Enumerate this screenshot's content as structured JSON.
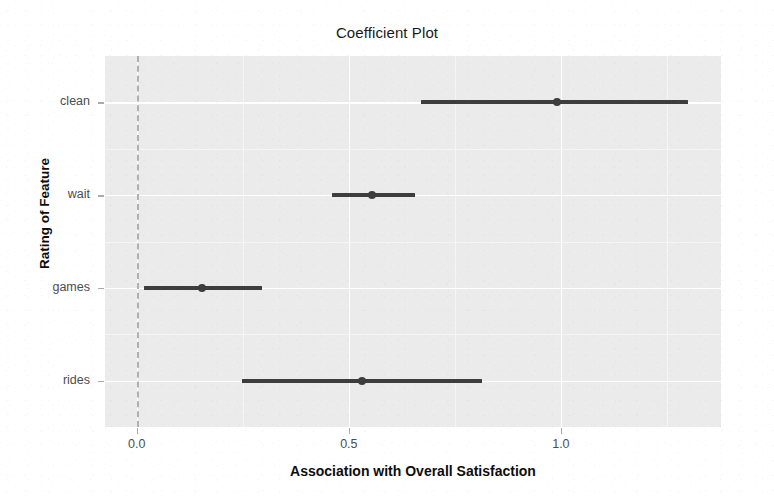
{
  "chart_data": {
    "type": "scatter",
    "title": "Coefficient Plot",
    "xlabel": "Association with Overall Satisfaction",
    "ylabel": "Rating of Feature",
    "xlim": [
      -0.075,
      1.3775
    ],
    "xticks": [
      0.0,
      0.5,
      1.0
    ],
    "xtick_labels": [
      "0.0",
      "0.5",
      "1.0"
    ],
    "x_minor_ticks": [
      0.25,
      0.75,
      1.25
    ],
    "categories": [
      "clean",
      "wait",
      "games",
      "rides"
    ],
    "grid": true,
    "legend": false,
    "reference_line": {
      "x": 0.0,
      "style": "dashed",
      "color": "#b0b0b0"
    },
    "orientation": "horizontal",
    "series": [
      {
        "name": "coefficient",
        "points": [
          {
            "category": "clean",
            "estimate": 0.99,
            "ci_low": 0.67,
            "ci_high": 1.3
          },
          {
            "category": "wait",
            "estimate": 0.555,
            "ci_low": 0.46,
            "ci_high": 0.655
          },
          {
            "category": "games",
            "estimate": 0.154,
            "ci_low": 0.018,
            "ci_high": 0.295
          },
          {
            "category": "rides",
            "estimate": 0.53,
            "ci_low": 0.248,
            "ci_high": 0.814
          }
        ]
      }
    ],
    "colors": {
      "panel_background": "#ebebeb",
      "gridline_major": "#ffffff",
      "gridline_minor": "#f5f5f5",
      "mark": "#3d3d3d",
      "axis_text": "#4d4d4d",
      "title_text": "#1a1a1a"
    }
  }
}
